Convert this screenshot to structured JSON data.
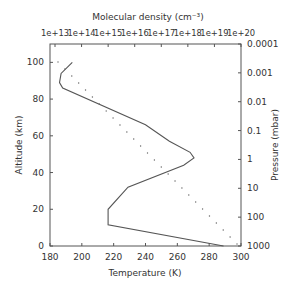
{
  "chart_data": {
    "type": "line",
    "title": "",
    "xlabel": "Temperature (K)",
    "ylabel": "Altitude (km)",
    "x2label": "Molecular density (cm⁻³)",
    "y2label": "Pressure (mbar)",
    "xlim": [
      180,
      300
    ],
    "ylim": [
      0,
      110
    ],
    "grid": false,
    "legend": null,
    "x_ticks": [
      "180",
      "200",
      "220",
      "240",
      "260",
      "280",
      "300"
    ],
    "y_ticks": [
      "0",
      "20",
      "40",
      "60",
      "80",
      "100"
    ],
    "x2_ticks": [
      "1e+13",
      "1e+14",
      "1e+15",
      "1e+16",
      "1e+17",
      "1e+18",
      "1e+19",
      "1e+20"
    ],
    "y2_ticks": [
      "1000",
      "100",
      "10",
      "1",
      "0.1",
      "0.01",
      "0.001",
      "0.0001"
    ],
    "series": [
      {
        "name": "Temperature",
        "style": "solid",
        "axis": "bottom",
        "points": [
          [
            194,
            100
          ],
          [
            187,
            94
          ],
          [
            186,
            89
          ],
          [
            188,
            86
          ],
          [
            240,
            66
          ],
          [
            255,
            57
          ],
          [
            268,
            51
          ],
          [
            270.5,
            48
          ],
          [
            264,
            44
          ],
          [
            229,
            32
          ],
          [
            216.5,
            20
          ],
          [
            216.5,
            11.5
          ],
          [
            289,
            0
          ]
        ]
      },
      {
        "name": "Molecular density",
        "style": "dotted",
        "axis": "top",
        "note": "log10 density decreasing roughly linearly with altitude",
        "points_log10": [
          [
            13.1,
            100
          ],
          [
            19.9,
            1
          ]
        ]
      }
    ]
  },
  "labels": {
    "x": "Temperature (K)",
    "y": "Altitude (km)",
    "x2": "Molecular density (cm⁻³)",
    "y2": "Pressure (mbar)"
  }
}
